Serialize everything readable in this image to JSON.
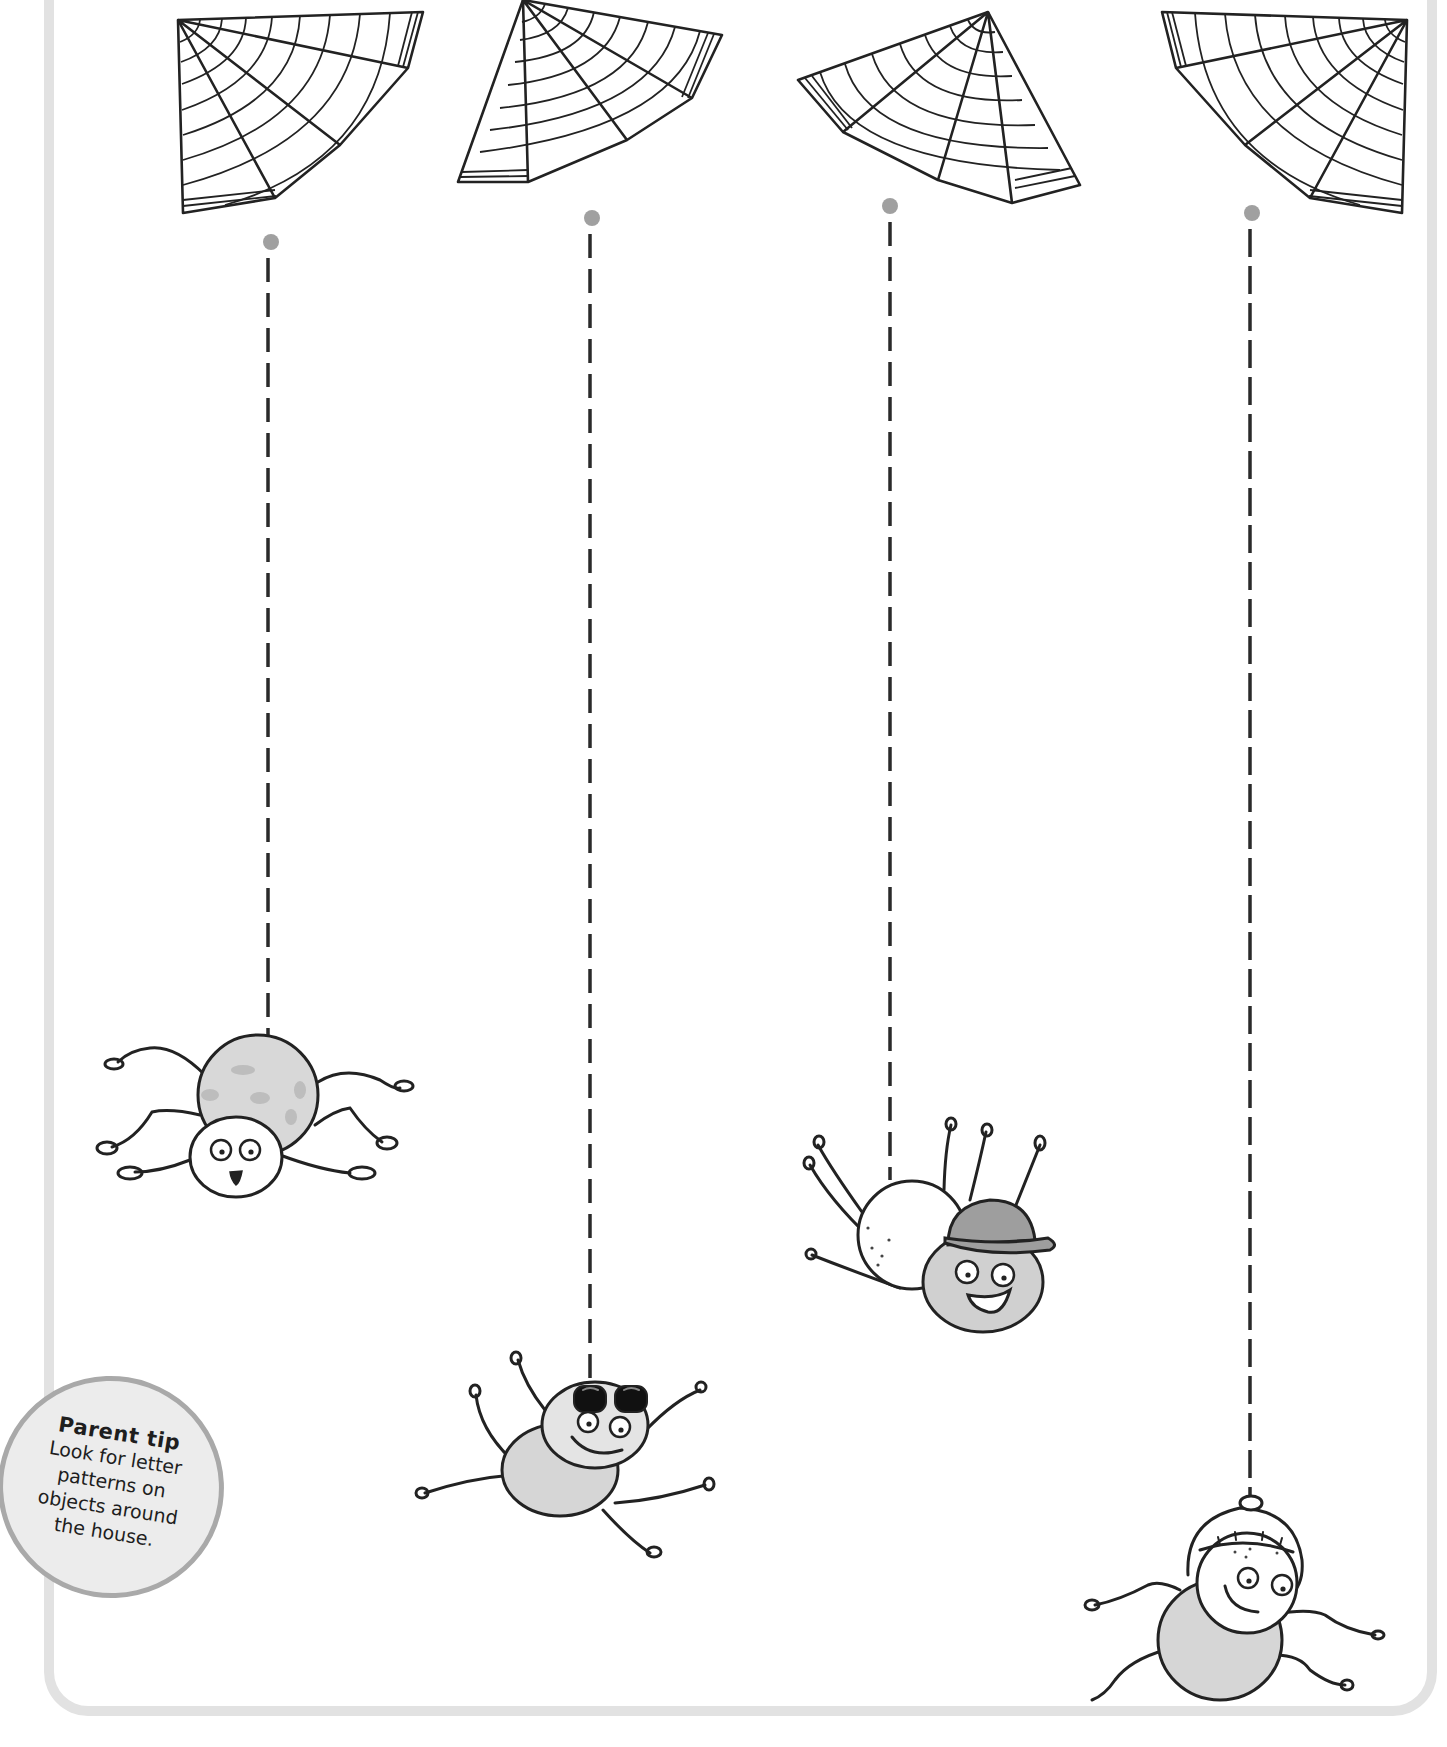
{
  "worksheet": {
    "activity": "Trace the dashed spider threads from each web down to its spider",
    "colors": {
      "ink": "#222222",
      "thread_dot": "#a0a0a0",
      "frame": "#e2e2e2",
      "spider_gray": "#d6d6d6",
      "tip_fill": "#ececec",
      "tip_border": "#a9a9a9"
    },
    "threads": [
      {
        "id": 1,
        "x": 268,
        "y_start": 242,
        "y_end": 1040,
        "spider": "surprised spider"
      },
      {
        "id": 2,
        "x": 590,
        "y_start": 218,
        "y_end": 1385,
        "spider": "spider with sunglasses"
      },
      {
        "id": 3,
        "x": 890,
        "y_start": 206,
        "y_end": 1180,
        "spider": "spider with bowler hat"
      },
      {
        "id": 4,
        "x": 1250,
        "y_start": 213,
        "y_end": 1500,
        "spider": "spider with helmet"
      }
    ]
  },
  "parent_tip": {
    "title": "Parent tip",
    "lines": [
      "Look for letter",
      "patterns on",
      "objects around",
      "the house."
    ]
  }
}
